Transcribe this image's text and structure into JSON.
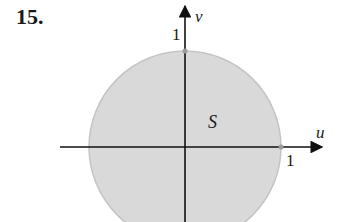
{
  "problem": {
    "number": "15."
  },
  "figure": {
    "region_label": "S",
    "axes": {
      "horizontal_label": "u",
      "vertical_label": "v"
    },
    "ticks": {
      "u_tick": "1",
      "v_tick": "1"
    },
    "shape": "disk",
    "fill_color": "#d9d9d9",
    "edge_color": "#bdbdbd",
    "axis_color": "#111111"
  }
}
